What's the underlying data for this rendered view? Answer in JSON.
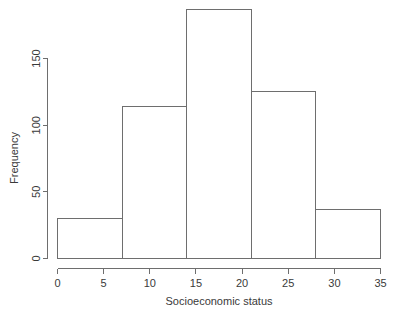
{
  "chart_data": {
    "type": "bar",
    "title": "",
    "subtitle": "",
    "xlabel": "Socioeconomic status",
    "ylabel": "Frequency",
    "categories": [
      "0-7",
      "7-14",
      "14-21",
      "21-28",
      "28-35"
    ],
    "bin_edges": [
      0,
      7,
      14,
      21,
      28,
      35
    ],
    "values": [
      30,
      114,
      187,
      125,
      37
    ],
    "xlim": [
      0,
      35
    ],
    "ylim": [
      0,
      187
    ],
    "xticks": [
      0,
      5,
      10,
      15,
      20,
      25,
      30,
      35
    ],
    "xtick_labels": [
      "0",
      "5",
      "10",
      "15",
      "20",
      "25",
      "30",
      "35"
    ],
    "yticks": [
      0,
      50,
      100,
      150
    ],
    "ytick_labels": [
      "0",
      "50",
      "100",
      "150"
    ],
    "grid": false,
    "legend": null,
    "legend_position": "none",
    "bar_fill": "none",
    "bar_stroke": "#6e6e6e",
    "axis_color": "#6e6e6e",
    "background": "#ffffff",
    "series": [
      {
        "name": "Frequency",
        "values": [
          30,
          114,
          187,
          125,
          37
        ]
      }
    ]
  },
  "axes": {
    "y_title": "Frequency",
    "x_title": "Socioeconomic status"
  },
  "x_labels": {
    "t0": "0",
    "t1": "5",
    "t2": "10",
    "t3": "15",
    "t4": "20",
    "t5": "25",
    "t6": "30",
    "t7": "35"
  },
  "y_labels": {
    "t0": "0",
    "t1": "50",
    "t2": "100",
    "t3": "150"
  }
}
